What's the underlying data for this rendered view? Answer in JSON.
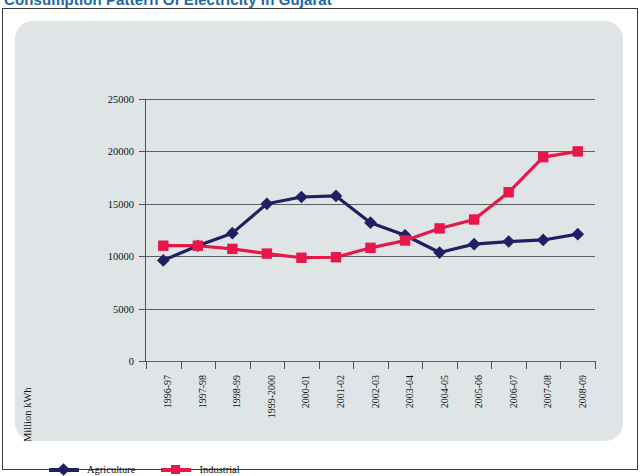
{
  "page": {
    "title": "Consumption Pattern Of Electricity in Gujarat"
  },
  "legend": {
    "items": [
      {
        "label": "Agriculture",
        "color": "#1f1f63",
        "marker": "diamond"
      },
      {
        "label": "Industrial",
        "color": "#e8174a",
        "marker": "square"
      }
    ]
  },
  "axis": {
    "y_title": "Million kWh"
  },
  "chart_data": {
    "type": "line",
    "title": "Consumption Pattern Of Electricity in Gujarat",
    "xlabel": "",
    "ylabel": "Million kWh",
    "ylim": [
      0,
      25000
    ],
    "yticks": [
      0,
      5000,
      10000,
      15000,
      20000,
      25000
    ],
    "ytick_labels": [
      "0",
      "5000",
      "10000",
      "15000",
      "20000",
      "25000"
    ],
    "grid": true,
    "legend_position": "bottom-left",
    "categories": [
      "1996-97",
      "1997-98",
      "1998-99",
      "1999-2000",
      "2000-01",
      "2001-02",
      "2002-03",
      "2003-04",
      "2004-05",
      "2005-06",
      "2006-07",
      "2007-08",
      "2008-09"
    ],
    "series": [
      {
        "name": "Agriculture",
        "color": "#1f1f63",
        "marker": "diamond",
        "values": [
          9600,
          11000,
          12200,
          15000,
          15650,
          15750,
          13200,
          12000,
          10350,
          11150,
          11400,
          11550,
          12100
        ]
      },
      {
        "name": "Industrial",
        "color": "#e8174a",
        "marker": "square",
        "values": [
          11000,
          11000,
          10700,
          10250,
          9850,
          9900,
          10800,
          11500,
          12650,
          13500,
          16100,
          19450,
          20000
        ]
      }
    ]
  }
}
